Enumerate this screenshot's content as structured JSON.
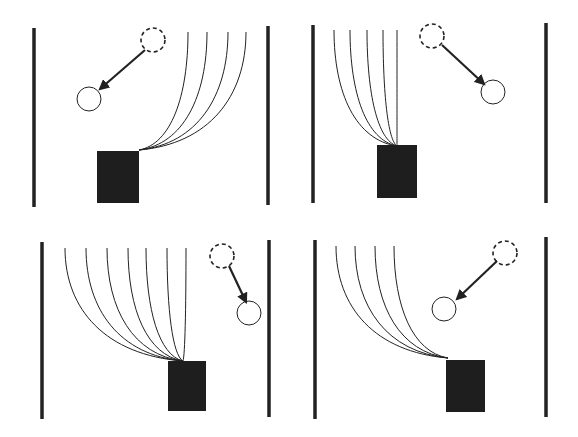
{
  "figure": {
    "width": 578,
    "height": 437,
    "background": "#ffffff",
    "ink": "#222222",
    "panels": [
      {
        "id": "top-left",
        "walls": [
          {
            "x": 34,
            "y1": 28,
            "y2": 207
          },
          {
            "x": 268,
            "y1": 26,
            "y2": 205
          }
        ],
        "box": {
          "x": 97,
          "y": 151,
          "w": 42,
          "h": 52
        },
        "trajectories": {
          "origin": [
            139,
            150
          ],
          "tops": [
            [
              188,
              32
            ],
            [
              207,
              32
            ],
            [
              228,
              32
            ],
            [
              246,
              32
            ]
          ]
        },
        "start_circle": {
          "cx": 153,
          "cy": 40,
          "r": 12
        },
        "end_circle": {
          "cx": 89,
          "cy": 99,
          "r": 12
        },
        "arrow": {
          "from": [
            145,
            50
          ],
          "to": [
            100,
            89
          ]
        }
      },
      {
        "id": "top-right",
        "walls": [
          {
            "x": 313,
            "y1": 25,
            "y2": 203
          },
          {
            "x": 546,
            "y1": 23,
            "y2": 203
          }
        ],
        "box": {
          "x": 377,
          "y": 145,
          "w": 40,
          "h": 53
        },
        "trajectories": {
          "origin": [
            397,
            146
          ],
          "tops": [
            [
              334,
              30
            ],
            [
              350,
              30
            ],
            [
              367,
              30
            ],
            [
              383,
              30
            ],
            [
              397,
              30
            ]
          ]
        },
        "start_circle": {
          "cx": 432,
          "cy": 36,
          "r": 12
        },
        "end_circle": {
          "cx": 493,
          "cy": 92,
          "r": 12
        },
        "arrow": {
          "from": [
            442,
            45
          ],
          "to": [
            484,
            84
          ]
        }
      },
      {
        "id": "bottom-left",
        "walls": [
          {
            "x": 42,
            "y1": 242,
            "y2": 419
          },
          {
            "x": 269,
            "y1": 240,
            "y2": 417
          }
        ],
        "box": {
          "x": 168,
          "y": 361,
          "w": 38,
          "h": 50
        },
        "trajectories": {
          "origin": [
            183,
            361
          ],
          "tops": [
            [
              65,
              248
            ],
            [
              86,
              248
            ],
            [
              107,
              248
            ],
            [
              128,
              248
            ],
            [
              146,
              248
            ],
            [
              167,
              248
            ],
            [
              186,
              248
            ]
          ]
        },
        "start_circle": {
          "cx": 222,
          "cy": 256,
          "r": 12
        },
        "end_circle": {
          "cx": 249,
          "cy": 313,
          "r": 12
        },
        "arrow": {
          "from": [
            229,
            266
          ],
          "to": [
            246,
            302
          ]
        }
      },
      {
        "id": "bottom-right",
        "walls": [
          {
            "x": 315,
            "y1": 240,
            "y2": 419
          },
          {
            "x": 546,
            "y1": 237,
            "y2": 417
          }
        ],
        "box": {
          "x": 446,
          "y": 360,
          "w": 39,
          "h": 52
        },
        "trajectories": {
          "origin": [
            448,
            358
          ],
          "tops": [
            [
              336,
              246
            ],
            [
              355,
              246
            ],
            [
              375,
              246
            ],
            [
              394,
              246
            ]
          ]
        },
        "start_circle": {
          "cx": 505,
          "cy": 253,
          "r": 12
        },
        "end_circle": {
          "cx": 444,
          "cy": 309,
          "r": 12
        },
        "arrow": {
          "from": [
            497,
            261
          ],
          "to": [
            457,
            299
          ]
        }
      }
    ]
  }
}
